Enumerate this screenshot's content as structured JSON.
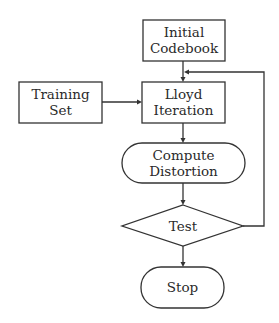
{
  "diagram": {
    "type": "flowchart",
    "nodes": {
      "initial_codebook": {
        "line1": "Initial",
        "line2": "Codebook",
        "shape": "rectangle"
      },
      "training_set": {
        "line1": "Training",
        "line2": "Set",
        "shape": "rectangle"
      },
      "lloyd_iteration": {
        "line1": "Lloyd",
        "line2": "Iteration",
        "shape": "rectangle"
      },
      "compute_distortion": {
        "line1": "Compute",
        "line2": "Distortion",
        "shape": "rounded"
      },
      "test": {
        "label": "Test",
        "shape": "diamond"
      },
      "stop": {
        "label": "Stop",
        "shape": "rounded"
      }
    },
    "edges": [
      {
        "from": "Initial Codebook",
        "to": "Lloyd Iteration"
      },
      {
        "from": "Training Set",
        "to": "Lloyd Iteration"
      },
      {
        "from": "Lloyd Iteration",
        "to": "Compute Distortion"
      },
      {
        "from": "Compute Distortion",
        "to": "Test"
      },
      {
        "from": "Test",
        "to": "Stop"
      },
      {
        "from": "Test",
        "to": "Lloyd Iteration",
        "note": "feedback loop"
      }
    ]
  }
}
